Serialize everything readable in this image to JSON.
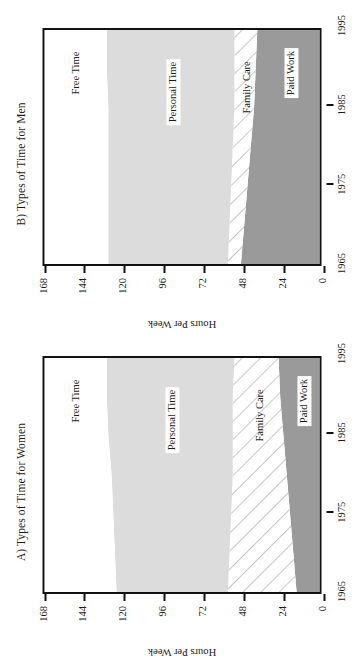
{
  "figure": {
    "orientation": "rotated-90-ccw",
    "background": "#ffffff",
    "axis_color": "#111111"
  },
  "panels": [
    {
      "key": "a",
      "title": "A) Types of Time for Women",
      "ylabel": "Hours Per Week",
      "yticks": [
        "0",
        "24",
        "48",
        "72",
        "96",
        "120",
        "144",
        "168"
      ],
      "xticks": [
        "1965",
        "1975",
        "1985",
        "1995"
      ],
      "band_labels": {
        "paid_work": "Paid Work",
        "family_care": "Family Care",
        "personal_time": "Personal Time",
        "free_time": "Free Time"
      }
    },
    {
      "key": "b",
      "title": "B) Types of Time for Men",
      "ylabel": "Hours Per Week",
      "yticks": [
        "0",
        "24",
        "48",
        "72",
        "96",
        "120",
        "144",
        "168"
      ],
      "xticks": [
        "1965",
        "1975",
        "1985",
        "1995"
      ],
      "band_labels": {
        "paid_work": "Paid Work",
        "family_care": "Family Care",
        "personal_time": "Personal Time",
        "free_time": "Free Time"
      }
    }
  ],
  "chart_data": [
    {
      "type": "area",
      "stacked": true,
      "title": "A) Types of Time for Women",
      "xlabel": "",
      "ylabel": "Hours Per Week",
      "x": [
        1965,
        1970,
        1975,
        1980,
        1985,
        1990,
        1995
      ],
      "xlim": [
        1965,
        1995
      ],
      "ylim": [
        0,
        168
      ],
      "yticks": [
        0,
        24,
        48,
        72,
        96,
        120,
        144,
        168
      ],
      "xticks": [
        1965,
        1975,
        1985,
        1995
      ],
      "grid": false,
      "legend": "inline-band-labels",
      "series": [
        {
          "name": "Paid Work",
          "values": [
            14,
            16,
            18,
            20,
            22,
            24,
            25
          ],
          "fill": "#9a9a9a",
          "pattern": "solid"
        },
        {
          "name": "Family Care",
          "values": [
            42,
            39,
            36,
            33,
            31,
            29,
            27
          ],
          "fill": "#ffffff",
          "pattern": "diagonal-hatch"
        },
        {
          "name": "Personal Time",
          "values": [
            68,
            70,
            72,
            74,
            76,
            77,
            78
          ],
          "fill": "#dcdcdc",
          "pattern": "solid"
        },
        {
          "name": "Free Time",
          "values": [
            44,
            43,
            42,
            41,
            39,
            38,
            38
          ],
          "fill": "#ffffff",
          "pattern": "solid"
        }
      ],
      "cumulative_tops": {
        "Paid Work": [
          14,
          16,
          18,
          20,
          22,
          24,
          25
        ],
        "Family Care": [
          56,
          55,
          54,
          53,
          53,
          53,
          52
        ],
        "Personal Time": [
          124,
          125,
          126,
          127,
          129,
          130,
          130
        ],
        "Free Time": [
          168,
          168,
          168,
          168,
          168,
          168,
          168
        ]
      }
    },
    {
      "type": "area",
      "stacked": true,
      "title": "B) Types of Time for Men",
      "xlabel": "",
      "ylabel": "Hours Per Week",
      "x": [
        1965,
        1970,
        1975,
        1980,
        1985,
        1990,
        1995
      ],
      "xlim": [
        1965,
        1995
      ],
      "ylim": [
        0,
        168
      ],
      "yticks": [
        0,
        24,
        48,
        72,
        96,
        120,
        144,
        168
      ],
      "xticks": [
        1965,
        1975,
        1985,
        1995
      ],
      "grid": false,
      "legend": "inline-band-labels",
      "series": [
        {
          "name": "Paid Work",
          "values": [
            48,
            46,
            44,
            42,
            40,
            39,
            38
          ],
          "fill": "#9a9a9a",
          "pattern": "solid"
        },
        {
          "name": "Family Care",
          "values": [
            8,
            9,
            10,
            11,
            12,
            13,
            14
          ],
          "fill": "#ffffff",
          "pattern": "diagonal-hatch"
        },
        {
          "name": "Personal Time",
          "values": [
            73,
            74,
            75,
            76,
            77,
            78,
            78
          ],
          "fill": "#dcdcdc",
          "pattern": "solid"
        },
        {
          "name": "Free Time",
          "values": [
            39,
            39,
            39,
            39,
            39,
            38,
            38
          ],
          "fill": "#ffffff",
          "pattern": "solid"
        }
      ],
      "cumulative_tops": {
        "Paid Work": [
          48,
          46,
          44,
          42,
          40,
          39,
          38
        ],
        "Family Care": [
          56,
          55,
          54,
          53,
          52,
          52,
          52
        ],
        "Personal Time": [
          129,
          129,
          129,
          129,
          129,
          130,
          130
        ],
        "Free Time": [
          168,
          168,
          168,
          168,
          168,
          168,
          168
        ]
      }
    }
  ]
}
